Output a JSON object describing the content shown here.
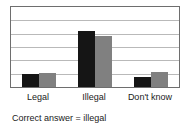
{
  "chart_data": {
    "type": "bar",
    "title": "",
    "subtitle": "",
    "xlabel": "",
    "ylabel": "",
    "ylim": [
      0,
      100
    ],
    "grid": true,
    "gridline_count": 5,
    "legend": "none",
    "categories": [
      "Legal",
      "Illegal",
      "Don't know"
    ],
    "series": [
      {
        "name": "series-a",
        "color": "#151515",
        "values": [
          16,
          70,
          13
        ]
      },
      {
        "name": "series-b",
        "color": "#808080",
        "values": [
          18,
          64,
          19
        ]
      }
    ]
  },
  "labels": {
    "category_0": "Legal",
    "category_1": "Illegal",
    "category_2": "Don't know"
  },
  "caption": {
    "text": "Correct answer = illegal"
  },
  "colors": {
    "series_a": "#151515",
    "series_b": "#808080",
    "frame": "#6e6e6e",
    "gridline": "#b9b9b9",
    "background": "#ffffff",
    "text": "#1a1a1a"
  }
}
